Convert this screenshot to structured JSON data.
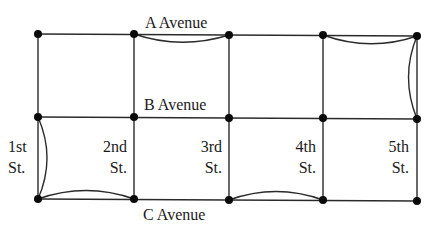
{
  "diagram": {
    "type": "street-grid-graph",
    "avenue_labels": {
      "a": "A Avenue",
      "b": "B Avenue",
      "c": "C Avenue"
    },
    "street_labels": [
      {
        "line1": "1st",
        "line2": "St."
      },
      {
        "line1": "2nd",
        "line2": "St."
      },
      {
        "line1": "3rd",
        "line2": "St."
      },
      {
        "line1": "4th",
        "line2": "St."
      },
      {
        "line1": "5th",
        "line2": "St."
      }
    ],
    "columns_x": [
      38,
      134,
      229,
      323,
      417
    ],
    "rows_y": [
      34,
      117,
      200
    ],
    "colors": {
      "line": "#2a2a2a",
      "node": "#0a0a0a",
      "background": "#ffffff"
    },
    "duplicated_edges": [
      {
        "from": "A-2nd",
        "to": "A-3rd"
      },
      {
        "from": "A-4th",
        "to": "A-5th"
      },
      {
        "from": "A-5th",
        "to": "B-5th"
      },
      {
        "from": "B-1st",
        "to": "C-1st"
      },
      {
        "from": "C-1st",
        "to": "C-2nd"
      },
      {
        "from": "C-3rd",
        "to": "C-4th"
      }
    ]
  }
}
